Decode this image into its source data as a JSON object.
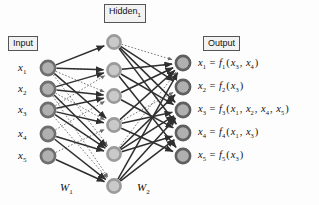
{
  "diagram": {
    "title_boxes": [
      {
        "id": "input",
        "label": "Input",
        "x": 8,
        "y": 36
      },
      {
        "id": "hidden1",
        "label": "Hidden",
        "sub": "1",
        "x": 104,
        "y": 4
      },
      {
        "id": "output",
        "label": "Output",
        "x": 203,
        "y": 36
      }
    ],
    "weights": [
      {
        "id": "w1",
        "label": "W",
        "sub": "1",
        "x": 60,
        "y": 181
      },
      {
        "id": "w2",
        "label": "W",
        "sub": "2",
        "x": 137,
        "y": 181
      }
    ],
    "layers": {
      "input": {
        "name": "Input",
        "nodes": [
          {
            "label": "x",
            "sub": "1",
            "cx": 48,
            "cy": 68
          },
          {
            "label": "x",
            "sub": "2",
            "cx": 48,
            "cy": 89
          },
          {
            "label": "x",
            "sub": "3",
            "cx": 48,
            "cy": 110
          },
          {
            "label": "x",
            "sub": "4",
            "cx": 48,
            "cy": 134
          },
          {
            "label": "x",
            "sub": "5",
            "cx": 48,
            "cy": 156
          }
        ],
        "fill": "#b0b0b0",
        "ring": "#6e6e6e"
      },
      "hidden": {
        "name": "Hidden1",
        "nodes": [
          {
            "cx": 114,
            "cy": 42
          },
          {
            "cx": 114,
            "cy": 70
          },
          {
            "cx": 114,
            "cy": 96
          },
          {
            "cx": 114,
            "cy": 125
          },
          {
            "cx": 114,
            "cy": 154
          },
          {
            "cx": 114,
            "cy": 186
          }
        ],
        "fill": "#c9c9c9",
        "ring": "#9a9a9a"
      },
      "output": {
        "name": "Output",
        "nodes": [
          {
            "label": "x",
            "sub": "1",
            "cx": 183,
            "cy": 63
          },
          {
            "label": "x",
            "sub": "2",
            "cx": 183,
            "cy": 87
          },
          {
            "label": "x",
            "sub": "3",
            "cx": 183,
            "cy": 110
          },
          {
            "label": "x",
            "sub": "4",
            "cx": 183,
            "cy": 133
          },
          {
            "label": "x",
            "sub": "5",
            "cx": 183,
            "cy": 156
          }
        ],
        "fill": "#b0b0b0",
        "ring": "#5f5f5f"
      }
    },
    "equations": [
      {
        "lhs": "x",
        "lhs_sub": "1",
        "fn": "f",
        "fn_sub": "1",
        "args": [
          {
            "v": "x",
            "s": "3"
          },
          {
            "v": "x",
            "s": "4"
          }
        ],
        "x": 198,
        "y": 57
      },
      {
        "lhs": "x",
        "lhs_sub": "2",
        "fn": "f",
        "fn_sub": "2",
        "args": [
          {
            "v": "x",
            "s": "3"
          }
        ],
        "x": 198,
        "y": 80
      },
      {
        "lhs": "x",
        "lhs_sub": "3",
        "fn": "f",
        "fn_sub": "3",
        "args": [
          {
            "v": "x",
            "s": "1"
          },
          {
            "v": "x",
            "s": "2"
          },
          {
            "v": "x",
            "s": "4"
          },
          {
            "v": "x",
            "s": "5"
          }
        ],
        "x": 198,
        "y": 103
      },
      {
        "lhs": "x",
        "lhs_sub": "4",
        "fn": "f",
        "fn_sub": "4",
        "args": [
          {
            "v": "x",
            "s": "1"
          },
          {
            "v": "x",
            "s": "3"
          }
        ],
        "x": 198,
        "y": 126
      },
      {
        "lhs": "x",
        "lhs_sub": "5",
        "fn": "f",
        "fn_sub": "5",
        "args": [
          {
            "v": "x",
            "s": "3"
          }
        ],
        "x": 198,
        "y": 149
      }
    ],
    "edges_w1_solid": [
      [
        0,
        0
      ],
      [
        0,
        1
      ],
      [
        0,
        3
      ],
      [
        1,
        1
      ],
      [
        1,
        2
      ],
      [
        1,
        4
      ],
      [
        2,
        2
      ],
      [
        2,
        3
      ],
      [
        2,
        4
      ],
      [
        3,
        4
      ],
      [
        3,
        5
      ],
      [
        4,
        5
      ]
    ],
    "edges_w1_dotted": [
      [
        0,
        1
      ],
      [
        0,
        2
      ],
      [
        0,
        3
      ],
      [
        0,
        4
      ],
      [
        1,
        3
      ],
      [
        1,
        5
      ],
      [
        2,
        1
      ],
      [
        2,
        5
      ],
      [
        3,
        2
      ],
      [
        4,
        3
      ]
    ],
    "edges_w2_solid": [
      [
        0,
        1
      ],
      [
        0,
        2
      ],
      [
        0,
        3
      ],
      [
        1,
        0
      ],
      [
        1,
        2
      ],
      [
        1,
        4
      ],
      [
        2,
        0
      ],
      [
        2,
        3
      ],
      [
        3,
        0
      ],
      [
        3,
        2
      ],
      [
        3,
        4
      ],
      [
        4,
        1
      ],
      [
        4,
        2
      ],
      [
        4,
        3
      ],
      [
        5,
        0
      ],
      [
        5,
        2
      ],
      [
        5,
        3
      ]
    ],
    "edges_w2_dotted": [
      [
        0,
        0
      ],
      [
        1,
        0
      ],
      [
        2,
        0
      ],
      [
        3,
        0
      ],
      [
        4,
        0
      ],
      [
        5,
        2
      ],
      [
        4,
        2
      ],
      [
        3,
        1
      ]
    ],
    "colors": {
      "stroke_solid": "#2f2f2f",
      "stroke_dotted": "#6b6b6b",
      "background": "#fdfdfd"
    }
  }
}
